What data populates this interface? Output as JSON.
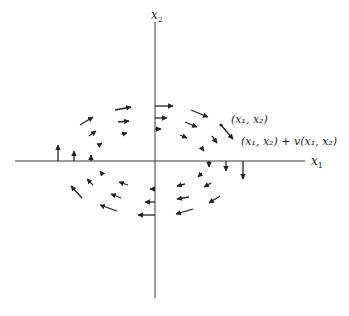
{
  "diagram": {
    "origin": [
      155,
      161
    ],
    "axes": {
      "x1": {
        "label": "x",
        "subscript": "1",
        "from": [
          15,
          161
        ],
        "to": [
          305,
          161
        ]
      },
      "x2": {
        "label": "x",
        "subscript": "2",
        "from": [
          155,
          22
        ],
        "to": [
          155,
          298
        ]
      }
    },
    "annotations": {
      "point": "(x₁, x₂)",
      "point_plus_vector": "(x₁, x₂) + v(x₁, x₂)"
    },
    "colors": {
      "ink": "#222222",
      "axis": "#3a3a3a",
      "background": "#ffffff"
    },
    "arrows": [
      {
        "from": [
          155,
          106
        ],
        "to": [
          173,
          106
        ]
      },
      {
        "from": [
          155,
          118
        ],
        "to": [
          167,
          118
        ]
      },
      {
        "from": [
          155,
          129
        ],
        "to": [
          161,
          129
        ]
      },
      {
        "from": [
          191,
          110
        ],
        "to": [
          208,
          117
        ]
      },
      {
        "from": [
          185,
          122
        ],
        "to": [
          197,
          127
        ]
      },
      {
        "from": [
          180,
          135
        ],
        "to": [
          187,
          138
        ]
      },
      {
        "from": [
          221,
          125
        ],
        "to": [
          233,
          139
        ]
      },
      {
        "from": [
          212,
          136
        ],
        "to": [
          217,
          143
        ]
      },
      {
        "from": [
          201,
          147
        ],
        "to": [
          204,
          151
        ]
      },
      {
        "from": [
          209,
          161
        ],
        "to": [
          209,
          167
        ]
      },
      {
        "from": [
          226,
          161
        ],
        "to": [
          226,
          171
        ]
      },
      {
        "from": [
          243,
          161
        ],
        "to": [
          243,
          179
        ]
      },
      {
        "from": [
          58,
          161
        ],
        "to": [
          58,
          145
        ]
      },
      {
        "from": [
          74,
          161
        ],
        "to": [
          74,
          151
        ]
      },
      {
        "from": [
          91,
          161
        ],
        "to": [
          91,
          155
        ]
      },
      {
        "from": [
          80,
          125
        ],
        "to": [
          93,
          117
        ]
      },
      {
        "from": [
          89,
          136
        ],
        "to": [
          96,
          131
        ]
      },
      {
        "from": [
          99,
          145
        ],
        "to": [
          102,
          143
        ]
      },
      {
        "from": [
          115,
          110
        ],
        "to": [
          131,
          107
        ]
      },
      {
        "from": [
          118,
          122
        ],
        "to": [
          129,
          121
        ]
      },
      {
        "from": [
          123,
          134
        ],
        "to": [
          127,
          133
        ]
      },
      {
        "from": [
          155,
          189
        ],
        "to": [
          150,
          189
        ]
      },
      {
        "from": [
          155,
          202
        ],
        "to": [
          145,
          202
        ]
      },
      {
        "from": [
          155,
          215
        ],
        "to": [
          138,
          215
        ]
      },
      {
        "from": [
          128,
          185
        ],
        "to": [
          119,
          182
        ]
      },
      {
        "from": [
          121,
          198
        ],
        "to": [
          111,
          194
        ]
      },
      {
        "from": [
          117,
          211
        ],
        "to": [
          100,
          205
        ]
      },
      {
        "from": [
          103,
          175
        ],
        "to": [
          100,
          171
        ]
      },
      {
        "from": [
          93,
          185
        ],
        "to": [
          87,
          179
        ]
      },
      {
        "from": [
          82,
          198
        ],
        "to": [
          71,
          186
        ]
      },
      {
        "from": [
          185,
          184
        ],
        "to": [
          177,
          186
        ]
      },
      {
        "from": [
          189,
          197
        ],
        "to": [
          177,
          199
        ]
      },
      {
        "from": [
          193,
          209
        ],
        "to": [
          176,
          214
        ]
      },
      {
        "from": [
          202,
          173
        ],
        "to": [
          198,
          177
        ]
      },
      {
        "from": [
          211,
          183
        ],
        "to": [
          204,
          187
        ]
      },
      {
        "from": [
          220,
          196
        ],
        "to": [
          209,
          203
        ]
      }
    ]
  }
}
